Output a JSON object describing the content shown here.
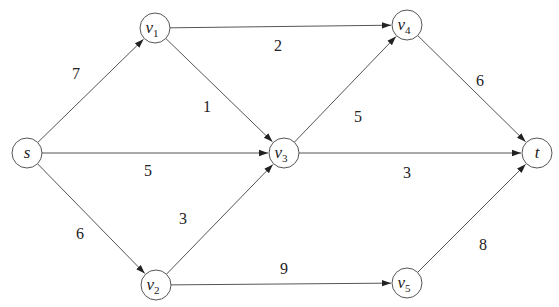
{
  "diagram": {
    "type": "directed-weighted-graph",
    "node_radius": 15,
    "stroke_color": "#555555",
    "nodes": [
      {
        "id": "s",
        "label": "s",
        "sub": "",
        "x": 27,
        "y": 153
      },
      {
        "id": "v1",
        "label": "v",
        "sub": "1",
        "x": 155,
        "y": 28
      },
      {
        "id": "v2",
        "label": "v",
        "sub": "2",
        "x": 156,
        "y": 285
      },
      {
        "id": "v3",
        "label": "v",
        "sub": "3",
        "x": 284,
        "y": 153
      },
      {
        "id": "v4",
        "label": "v",
        "sub": "4",
        "x": 407,
        "y": 25
      },
      {
        "id": "v5",
        "label": "v",
        "sub": "5",
        "x": 407,
        "y": 283
      },
      {
        "id": "t",
        "label": "t",
        "sub": "",
        "x": 537,
        "y": 153
      }
    ],
    "edges": [
      {
        "from": "s",
        "to": "v1",
        "weight": "7",
        "lx": 76,
        "ly": 75
      },
      {
        "from": "s",
        "to": "v3",
        "weight": "5",
        "lx": 148,
        "ly": 172
      },
      {
        "from": "s",
        "to": "v2",
        "weight": "6",
        "lx": 80,
        "ly": 235
      },
      {
        "from": "v1",
        "to": "v4",
        "weight": "2",
        "lx": 278,
        "ly": 47
      },
      {
        "from": "v1",
        "to": "v3",
        "weight": "1",
        "lx": 207,
        "ly": 108
      },
      {
        "from": "v2",
        "to": "v3",
        "weight": "3",
        "lx": 183,
        "ly": 220
      },
      {
        "from": "v2",
        "to": "v5",
        "weight": "9",
        "lx": 284,
        "ly": 270
      },
      {
        "from": "v3",
        "to": "v4",
        "weight": "5",
        "lx": 358,
        "ly": 118
      },
      {
        "from": "v3",
        "to": "t",
        "weight": "3",
        "lx": 407,
        "ly": 174
      },
      {
        "from": "v4",
        "to": "t",
        "weight": "6",
        "lx": 480,
        "ly": 82
      },
      {
        "from": "v5",
        "to": "t",
        "weight": "8",
        "lx": 483,
        "ly": 246
      }
    ]
  }
}
